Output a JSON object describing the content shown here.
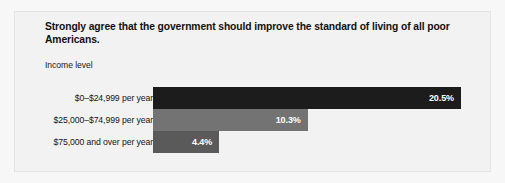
{
  "figure": {
    "background_color": "#f7f7f7",
    "panel_color": "#f2f2f2",
    "panel_border_color": "#e4e4e4"
  },
  "chart_data": {
    "type": "bar",
    "orientation": "horizontal",
    "title": "Strongly agree that the government should improve the standard of living of all poor Americans.",
    "subtitle": "",
    "xlabel": "",
    "ylabel": "Income level",
    "axis_group_label": "Income level",
    "categories": [
      "$0–$24,999 per year",
      "$25,000–$74,999 per year",
      "$75,000 and over per year"
    ],
    "values": [
      20.5,
      10.3,
      4.4
    ],
    "value_labels": [
      "20.5%",
      "10.3%",
      "4.4%"
    ],
    "value_suffix": "%",
    "bar_colors": [
      "#1c1c1c",
      "#737373",
      "#5a5a5a"
    ],
    "value_label_color": "#ffffff",
    "xlim": [
      0,
      20.5
    ],
    "grid": false,
    "legend": null,
    "legend_position": "none",
    "axis_line": false,
    "tick_labels": []
  }
}
